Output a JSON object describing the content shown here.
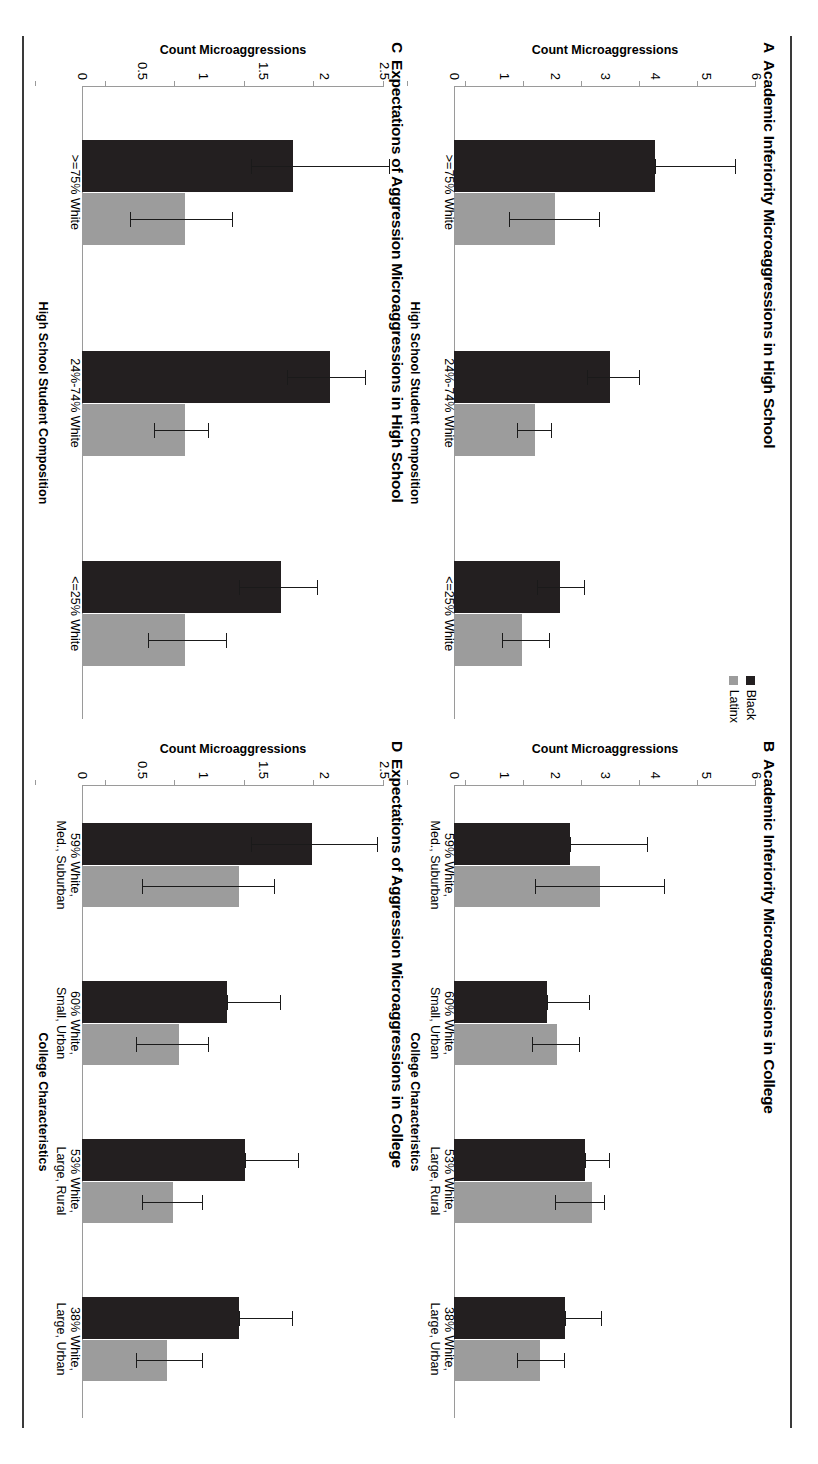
{
  "legend": {
    "items": [
      {
        "label": "Black",
        "color": "#231f20"
      },
      {
        "label": "Latinx",
        "color": "#9c9c9c"
      }
    ]
  },
  "chart_data": [
    {
      "panel": "A",
      "type": "bar",
      "title": "Academic Inferiority Microaggressions in High School",
      "xlabel": "High School Student Composition",
      "ylabel": "Count Microaggressions",
      "categories": [
        ">=75% White",
        "24%-74% White",
        "<=25% White"
      ],
      "ylim": [
        0,
        6
      ],
      "yticks": [
        0,
        1,
        2,
        3,
        4,
        5,
        6
      ],
      "yticklabels": [
        "0",
        "1",
        "2",
        "3",
        "4",
        "5",
        "6"
      ],
      "grid": false,
      "legend_position": "top-right",
      "series": [
        {
          "name": "Black",
          "color": "#231f20",
          "values": [
            4.0,
            3.1,
            2.1
          ],
          "err_low": [
            4.0,
            2.65,
            1.65
          ],
          "err_high": [
            5.6,
            3.7,
            2.6
          ]
        },
        {
          "name": "Latinx",
          "color": "#9c9c9c",
          "values": [
            2.0,
            1.6,
            1.35
          ],
          "err_low": [
            1.1,
            1.25,
            0.95
          ],
          "err_high": [
            2.9,
            1.95,
            1.9
          ]
        }
      ]
    },
    {
      "panel": "B",
      "type": "bar",
      "title": "Academic Inferiority Microaggressions in College",
      "xlabel": "College Characteristics",
      "ylabel": "Count Microaggressions",
      "categories": [
        "59% White,\nMed., Suburban",
        "60% White,\nSmall, Urban",
        "53% White,\nLarge, Rural",
        "38% White,\nLarge, Urban"
      ],
      "ylim": [
        0,
        6
      ],
      "yticks": [
        0,
        1,
        2,
        3,
        4,
        5,
        6
      ],
      "yticklabels": [
        "0",
        "1",
        "2",
        "3",
        "4",
        "5",
        "6"
      ],
      "grid": false,
      "legend_position": "none",
      "series": [
        {
          "name": "Black",
          "color": "#231f20",
          "values": [
            2.3,
            1.85,
            2.6,
            2.2
          ],
          "err_low": [
            2.3,
            1.85,
            2.6,
            2.2
          ],
          "err_high": [
            3.85,
            2.7,
            3.1,
            2.95
          ]
        },
        {
          "name": "Latinx",
          "color": "#9c9c9c",
          "values": [
            2.9,
            2.05,
            2.75,
            1.7
          ],
          "err_low": [
            1.6,
            1.55,
            2.0,
            1.25
          ],
          "err_high": [
            4.2,
            2.5,
            3.0,
            2.2
          ]
        }
      ]
    },
    {
      "panel": "C",
      "type": "bar",
      "title": "Expectations of Aggression Microaggressions in High School",
      "xlabel": "High School Student Composition",
      "ylabel": "Count Microaggressions",
      "categories": [
        ">=75% White",
        "24%-74% White",
        "<=25% White"
      ],
      "ylim": [
        0,
        2.5
      ],
      "yticks": [
        0,
        0.5,
        1,
        1.5,
        2,
        2.5
      ],
      "yticklabels": [
        "0",
        "0.5",
        "1",
        "1.5",
        "2",
        "2.5"
      ],
      "grid": false,
      "legend_position": "none",
      "series": [
        {
          "name": "Black",
          "color": "#231f20",
          "values": [
            1.75,
            2.05,
            1.65
          ],
          "err_low": [
            1.4,
            1.7,
            1.3
          ],
          "err_high": [
            2.55,
            2.35,
            1.95
          ]
        },
        {
          "name": "Latinx",
          "color": "#9c9c9c",
          "values": [
            0.85,
            0.85,
            0.85
          ],
          "err_low": [
            0.4,
            0.6,
            0.55
          ],
          "err_high": [
            1.25,
            1.05,
            1.2
          ]
        }
      ]
    },
    {
      "panel": "D",
      "type": "bar",
      "title": "Expectations of Aggression Microaggressions in College",
      "xlabel": "College Characteristics",
      "ylabel": "Count Microaggressions",
      "categories": [
        "59% White,\nMed., Suburban",
        "60% White,\nSmall, Urban",
        "53% White,\nLarge, Rural",
        "38% White,\nLarge, Urban"
      ],
      "ylim": [
        0,
        2.5
      ],
      "yticks": [
        0,
        0.5,
        1,
        1.5,
        2,
        2.5
      ],
      "yticklabels": [
        "0",
        "0.5",
        "1",
        "1.5",
        "2",
        "2.5"
      ],
      "grid": false,
      "legend_position": "none",
      "series": [
        {
          "name": "Black",
          "color": "#231f20",
          "values": [
            1.9,
            1.2,
            1.35,
            1.3
          ],
          "err_low": [
            1.4,
            1.2,
            1.35,
            1.3
          ],
          "err_high": [
            2.45,
            1.65,
            1.8,
            1.75
          ]
        },
        {
          "name": "Latinx",
          "color": "#9c9c9c",
          "values": [
            1.3,
            0.8,
            0.75,
            0.7
          ],
          "err_low": [
            0.5,
            0.45,
            0.5,
            0.45
          ],
          "err_high": [
            1.6,
            1.05,
            1.0,
            1.0
          ]
        }
      ]
    }
  ]
}
